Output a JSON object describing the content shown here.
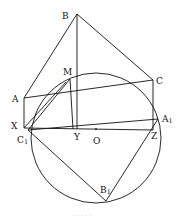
{
  "diagram": {
    "type": "geometry-figure",
    "points": {
      "B": {
        "label": "B",
        "x": 77,
        "y": 14
      },
      "M": {
        "label": "M",
        "x": 70,
        "y": 79
      },
      "C": {
        "label": "C",
        "x": 153,
        "y": 80
      },
      "A": {
        "label": "A",
        "x": 24,
        "y": 98
      },
      "X": {
        "label": "X",
        "x": 24,
        "y": 128
      },
      "C1": {
        "label": "C",
        "sub": "1",
        "x": 28,
        "y": 130
      },
      "Y": {
        "label": "Y",
        "x": 77,
        "y": 129
      },
      "A1": {
        "label": "A",
        "sub": "1",
        "x": 158,
        "y": 119
      },
      "Z": {
        "label": "Z",
        "x": 153,
        "y": 130
      },
      "O": {
        "label": "O",
        "x": 96,
        "y": 138
      },
      "B1": {
        "label": "B",
        "sub": "1",
        "x": 106,
        "y": 201
      }
    },
    "circle": {
      "center": "O",
      "r": 65
    },
    "caption": "· · · · ·"
  }
}
